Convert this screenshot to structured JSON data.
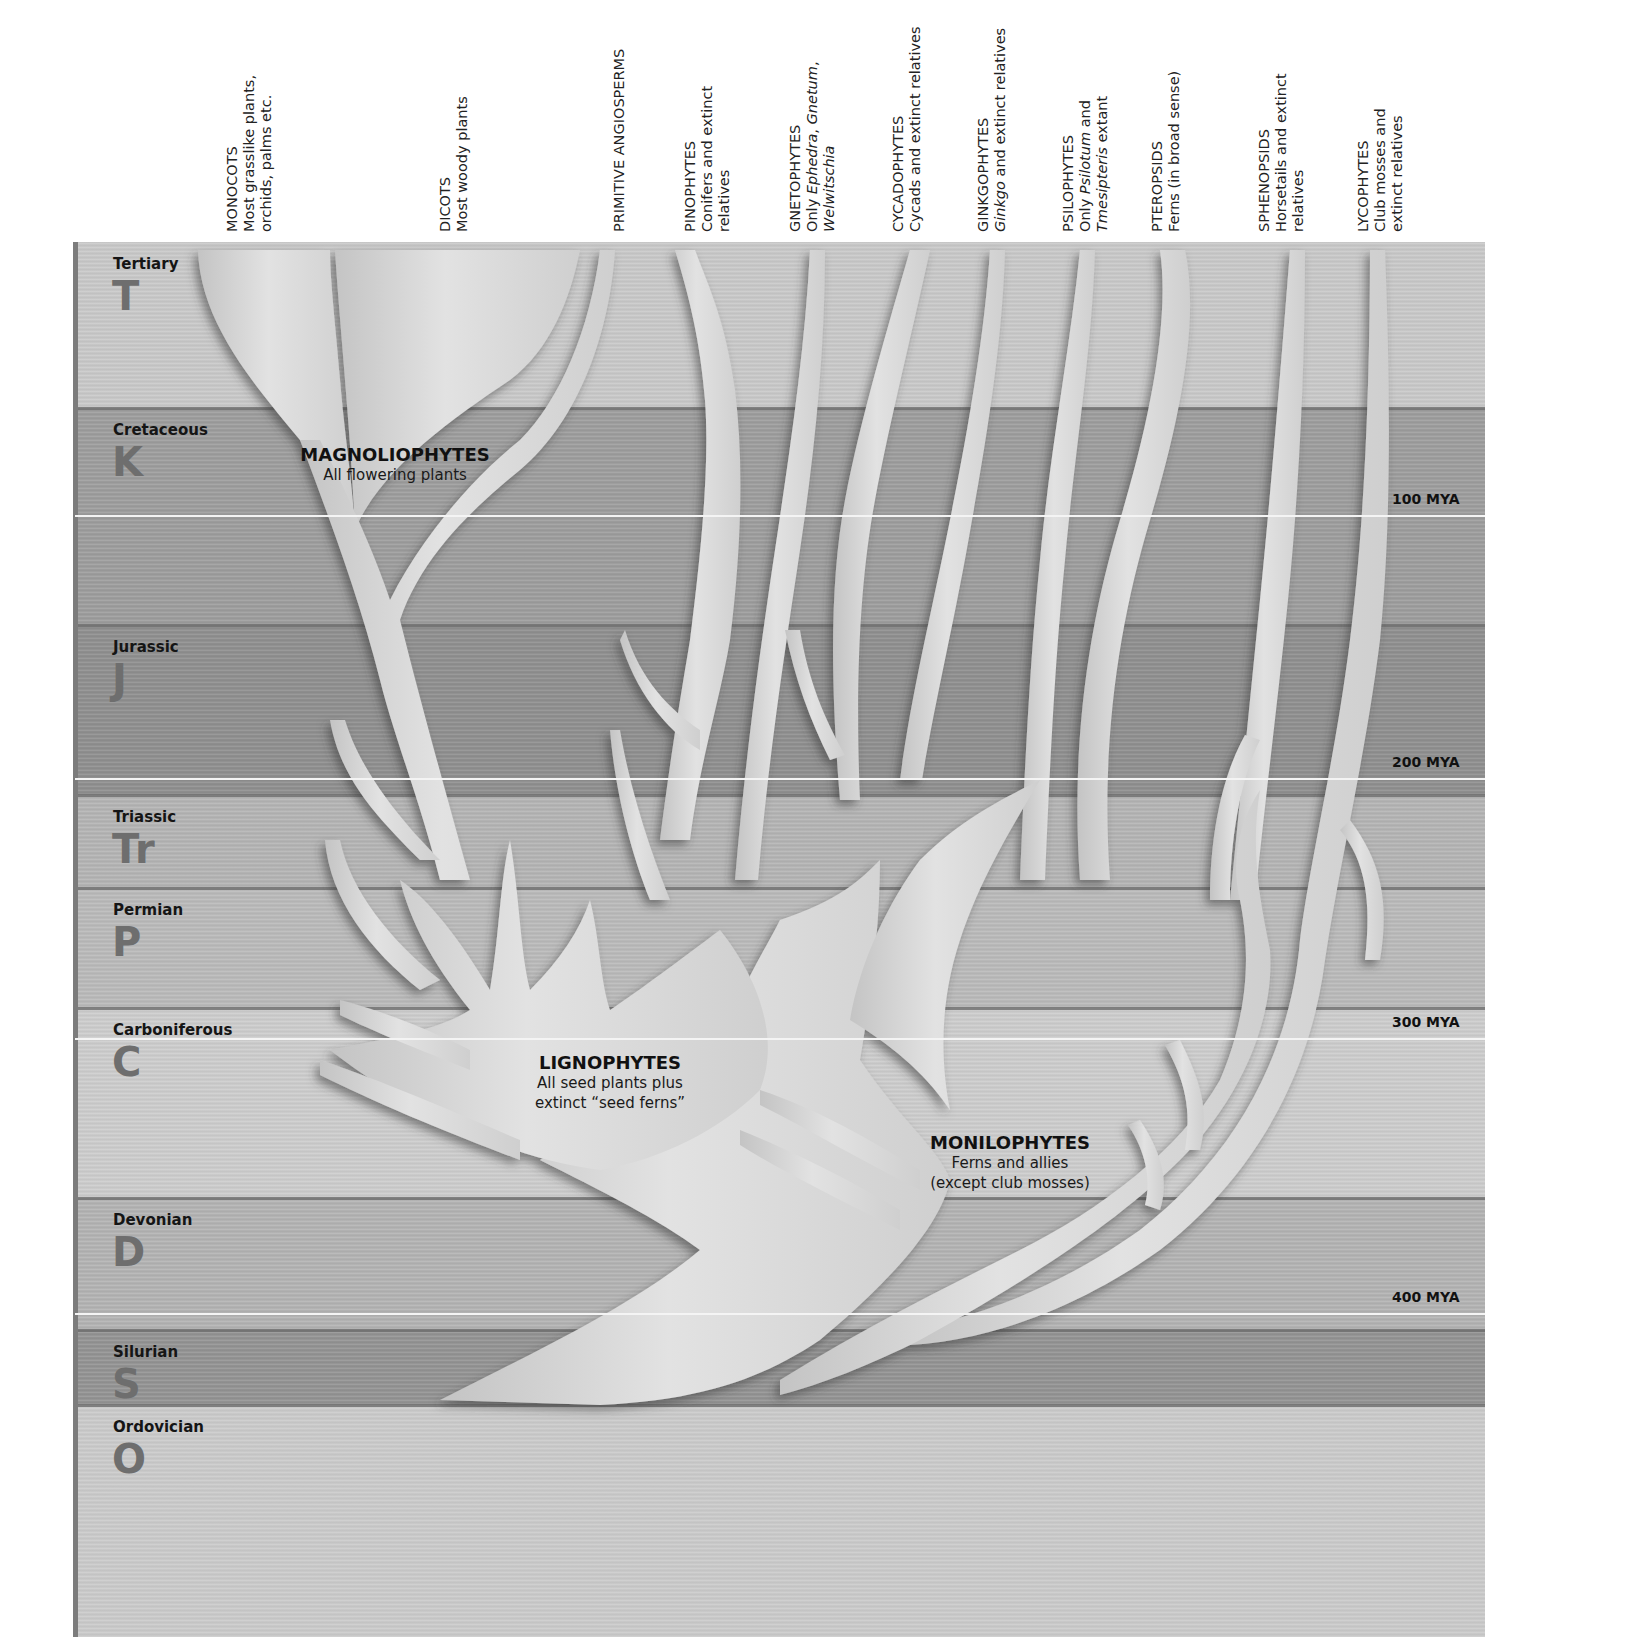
{
  "columns": [
    {
      "id": "monocots",
      "title": "MONOCOTS",
      "desc_lines": [
        "Most grasslike plants,",
        "orchids, palms etc."
      ],
      "x": 230
    },
    {
      "id": "dicots",
      "title": "DICOTS",
      "desc_lines": [
        "Most woody plants"
      ],
      "x": 443
    },
    {
      "id": "primitive-angiosperms",
      "title": "PRIMITIVE ANGIOSPERMS",
      "desc_lines": [],
      "x": 617
    },
    {
      "id": "pinophytes",
      "title": "PINOPHYTES",
      "desc_lines": [
        "Conifers and extinct",
        "relatives"
      ],
      "x": 688
    },
    {
      "id": "gnetophytes",
      "title": "GNETOPHYTES",
      "desc_lines": [
        "Only Ephedra, Gnetum,",
        "Welwitschia"
      ],
      "x": 793
    },
    {
      "id": "cycadophytes",
      "title": "CYCADOPHYTES",
      "desc_lines": [
        "Cycads and extinct relatives"
      ],
      "x": 896
    },
    {
      "id": "ginkgophytes",
      "title": "GINKGOPHYTES",
      "desc_lines": [
        "Ginkgo and extinct relatives"
      ],
      "x": 981
    },
    {
      "id": "psilophytes",
      "title": "PSILOPHYTES",
      "desc_lines": [
        "Only Psilotum and",
        "Tmesipteris extant"
      ],
      "x": 1066
    },
    {
      "id": "pteropsids",
      "title": "PTEROPSIDS",
      "desc_lines": [
        "Ferns (in broad sense)"
      ],
      "x": 1155
    },
    {
      "id": "sphenopsids",
      "title": "SPHENOPSIDS",
      "desc_lines": [
        "Horsetails and extinct",
        "relatives"
      ],
      "x": 1262
    },
    {
      "id": "lycophytes",
      "title": "LYCOPHYTES",
      "desc_lines": [
        "Club mosses and",
        "extinct relatives"
      ],
      "x": 1361
    }
  ],
  "periods": [
    {
      "name": "Tertiary",
      "abbr": "T",
      "top": 242,
      "bottom": 408,
      "color": "#c9c9c9"
    },
    {
      "name": "Cretaceous",
      "abbr": "K",
      "top": 408,
      "bottom": 625,
      "color": "#9d9d9d"
    },
    {
      "name": "Jurassic",
      "abbr": "J",
      "top": 625,
      "bottom": 795,
      "color": "#8f8f8f"
    },
    {
      "name": "Triassic",
      "abbr": "Tr",
      "top": 795,
      "bottom": 888,
      "color": "#b4b4b4"
    },
    {
      "name": "Permian",
      "abbr": "P",
      "top": 888,
      "bottom": 1008,
      "color": "#bababa"
    },
    {
      "name": "Carboniferous",
      "abbr": "C",
      "top": 1008,
      "bottom": 1198,
      "color": "#cdcdcd"
    },
    {
      "name": "Devonian",
      "abbr": "D",
      "top": 1198,
      "bottom": 1330,
      "color": "#b3b3b3"
    },
    {
      "name": "Silurian",
      "abbr": "S",
      "top": 1330,
      "bottom": 1405,
      "color": "#939393"
    },
    {
      "name": "Ordovician",
      "abbr": "O",
      "top": 1405,
      "bottom": 1637,
      "color": "#cbcbcb"
    }
  ],
  "mya_markers": [
    {
      "label": "100 MYA",
      "y": 507
    },
    {
      "label": "200 MYA",
      "y": 770
    },
    {
      "label": "300 MYA",
      "y": 1030
    },
    {
      "label": "400 MYA",
      "y": 1305
    }
  ],
  "groups": {
    "magnoliophytes": {
      "title": "MAGNOLIOPHYTES",
      "subtitle_lines": [
        "All flowering plants"
      ]
    },
    "lignophytes": {
      "title": "LIGNOPHYTES",
      "subtitle_lines": [
        "All seed plants plus",
        "extinct “seed ferns”"
      ]
    },
    "monilophytes": {
      "title": "MONILOPHYTES",
      "subtitle_lines": [
        "Ferns and allies",
        "(except club mosses)"
      ]
    }
  },
  "colors": {
    "branch_fill": "#d6d6d6",
    "branch_highlight": "#e8e8e8",
    "branch_shadow": "#5a5a5a",
    "boundary_dark": "#6d6d6d",
    "boundary_light": "#f4f4f4",
    "abbr_color": "#6e6e6e"
  }
}
